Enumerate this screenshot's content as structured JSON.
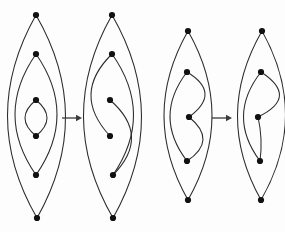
{
  "figure": {
    "background_color": "#fdfdfd",
    "edge_color": "#2b2b2b",
    "node_color": "#111111",
    "arrow_color": "#3a3a3a",
    "width": 285,
    "height": 232,
    "node_radius": 3.1
  },
  "arrows": [
    {
      "name": "transform-arrow-1",
      "glyph": "→",
      "x1": 62,
      "y1": 118,
      "x2": 82,
      "y2": 118
    },
    {
      "name": "transform-arrow-2",
      "glyph": "→",
      "x1": 212,
      "y1": 118,
      "x2": 232,
      "y2": 118
    }
  ],
  "graphs": [
    {
      "id": "graph-1",
      "label": "left-pair-before",
      "node_count": 6,
      "nodes": [
        {
          "id": "a1",
          "x": 36,
          "y": 15
        },
        {
          "id": "a2",
          "x": 36,
          "y": 54
        },
        {
          "id": "a3",
          "x": 36,
          "y": 100
        },
        {
          "id": "a4",
          "x": 36,
          "y": 136
        },
        {
          "id": "a5",
          "x": 36,
          "y": 175
        },
        {
          "id": "a6",
          "x": 37,
          "y": 218
        }
      ],
      "edges": [
        {
          "from": "a1",
          "to": "a6",
          "bow": -29,
          "name": "outer-left-arc"
        },
        {
          "from": "a1",
          "to": "a6",
          "bow": 29,
          "name": "outer-right-arc"
        },
        {
          "from": "a2",
          "to": "a5",
          "bow": -21,
          "name": "middle-left-arc"
        },
        {
          "from": "a2",
          "to": "a5",
          "bow": 21,
          "name": "middle-right-arc"
        },
        {
          "from": "a3",
          "to": "a4",
          "bow": -11,
          "name": "inner-left-arc"
        },
        {
          "from": "a3",
          "to": "a4",
          "bow": 11,
          "name": "inner-right-arc"
        }
      ]
    },
    {
      "id": "graph-2",
      "label": "left-pair-after",
      "node_count": 6,
      "nodes": [
        {
          "id": "b1",
          "x": 112,
          "y": 15
        },
        {
          "id": "b2",
          "x": 112,
          "y": 54
        },
        {
          "id": "b3",
          "x": 110,
          "y": 100
        },
        {
          "id": "b4",
          "x": 110,
          "y": 136
        },
        {
          "id": "b5",
          "x": 113,
          "y": 175
        },
        {
          "id": "b6",
          "x": 113,
          "y": 218
        }
      ],
      "edges": [
        {
          "from": "b1",
          "to": "b6",
          "bow": -29,
          "name": "outer-left-arc"
        },
        {
          "from": "b1",
          "to": "b6",
          "bow": 29,
          "name": "outer-right-arc"
        },
        {
          "from": "b2",
          "to": "b5",
          "bow": -21,
          "name": "middle-left-arc"
        },
        {
          "from": "b2",
          "to": "b4",
          "bow": 20,
          "name": "crossing-arc-upper"
        },
        {
          "from": "b3",
          "to": "b5",
          "bow": -20,
          "name": "crossing-arc-lower"
        }
      ]
    },
    {
      "id": "graph-3",
      "label": "right-pair-before",
      "node_count": 5,
      "nodes": [
        {
          "id": "c1",
          "x": 188,
          "y": 31
        },
        {
          "id": "c2",
          "x": 187,
          "y": 72
        },
        {
          "id": "c3",
          "x": 189,
          "y": 117
        },
        {
          "id": "c4",
          "x": 187,
          "y": 161
        },
        {
          "id": "c5",
          "x": 188,
          "y": 200
        }
      ],
      "edges": [
        {
          "from": "c1",
          "to": "c5",
          "bow": -24,
          "name": "outer-left-arc"
        },
        {
          "from": "c1",
          "to": "c5",
          "bow": 24,
          "name": "outer-right-arc"
        },
        {
          "from": "c2",
          "to": "c4",
          "bow": 17,
          "name": "middle-right-arc"
        },
        {
          "from": "c2",
          "to": "c3",
          "bow": -17,
          "name": "crossing-arc-upper"
        },
        {
          "from": "c3",
          "to": "c4",
          "bow": -15,
          "name": "inner-left-arc"
        }
      ]
    },
    {
      "id": "graph-4",
      "label": "right-pair-after",
      "node_count": 5,
      "nodes": [
        {
          "id": "d1",
          "x": 262,
          "y": 31
        },
        {
          "id": "d2",
          "x": 261,
          "y": 72
        },
        {
          "id": "d3",
          "x": 258,
          "y": 117
        },
        {
          "id": "d4",
          "x": 260,
          "y": 161
        },
        {
          "id": "d5",
          "x": 261,
          "y": 200
        }
      ],
      "edges": [
        {
          "from": "d1",
          "to": "d5",
          "bow": -24,
          "name": "outer-left-arc"
        },
        {
          "from": "d1",
          "to": "d5",
          "bow": 24,
          "name": "outer-right-arc"
        },
        {
          "from": "d2",
          "to": "d4",
          "bow": 17,
          "name": "middle-right-arc"
        },
        {
          "from": "d2",
          "to": "d3",
          "bow": -20,
          "name": "crossing-arc-upper"
        },
        {
          "from": "d3",
          "to": "d4",
          "bow": -2,
          "name": "short-link"
        }
      ]
    }
  ]
}
